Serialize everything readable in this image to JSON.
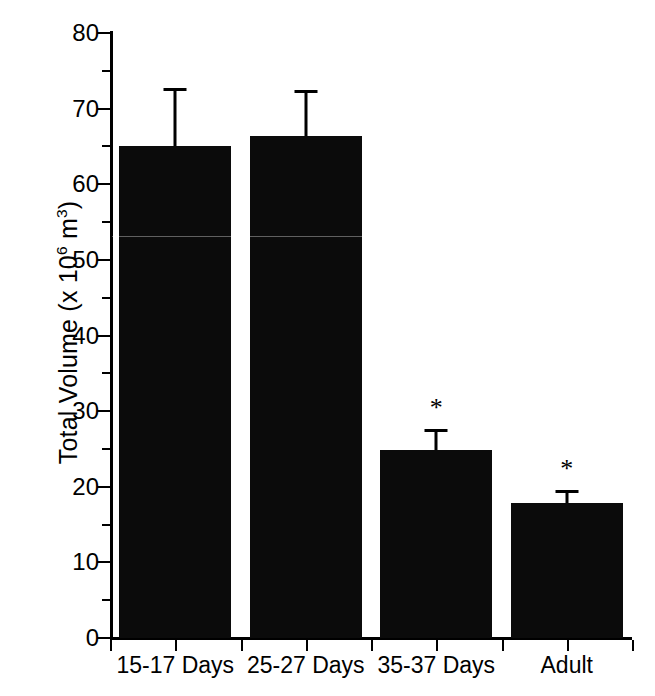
{
  "chart_data": {
    "type": "bar",
    "title": "",
    "xlabel": "",
    "ylabel": "Total Volume (x 10^6 m^3)",
    "ylabel_parts": {
      "prefix": "Total Volume (x 10",
      "exp1": "6",
      "mid": " m",
      "exp2": "3",
      "suffix": ")"
    },
    "categories": [
      "15-17 Days",
      "25-27 Days",
      "35-37 Days",
      "Adult"
    ],
    "values": [
      65.0,
      66.4,
      24.9,
      17.9
    ],
    "errors": [
      7.7,
      6.0,
      2.8,
      1.7
    ],
    "error_upper": [
      72.7,
      72.4,
      27.7,
      19.6
    ],
    "annotations": [
      "",
      "",
      "*",
      "*"
    ],
    "ylim": [
      0,
      80
    ],
    "ytick_major": [
      0,
      10,
      20,
      30,
      40,
      50,
      60,
      70,
      80
    ],
    "ytick_minor": [
      5,
      15,
      25,
      35,
      45,
      55,
      65,
      75
    ],
    "ytick_labels": [
      "0",
      "10",
      "20",
      "30",
      "40",
      "50",
      "60",
      "70",
      "80"
    ],
    "grid": false,
    "legend": null,
    "bar_color": "#0b0b0b",
    "axis_color": "#000000",
    "significance_note": "*"
  }
}
